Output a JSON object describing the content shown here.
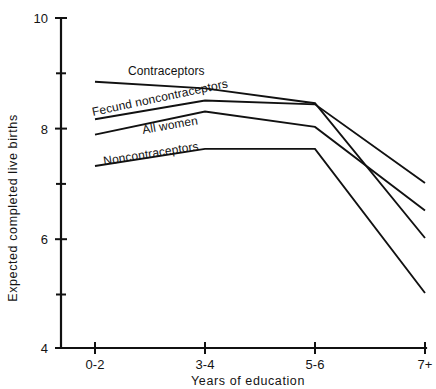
{
  "chart_data": {
    "type": "line",
    "title": "",
    "xlabel": "Years  of  education",
    "ylabel": "Expected  completed  live  births",
    "categories": [
      "0-2",
      "3-4",
      "5-6",
      "7+"
    ],
    "ylim": [
      4,
      10
    ],
    "xlim": [
      0,
      3
    ],
    "grid": false,
    "legend": "inline-labels",
    "y_ticks_major": [
      "4",
      "6",
      "8",
      "10"
    ],
    "y_tick_values_major": [
      4,
      6,
      8,
      10
    ],
    "y_tick_values_minor": [
      5,
      7,
      9
    ],
    "series": [
      {
        "name": "Contraceptors",
        "values": [
          8.84,
          8.72,
          8.45,
          6.0
        ],
        "label": "Contraceptors",
        "label_x": 128,
        "label_y": 75,
        "label_rotation": 0
      },
      {
        "name": "Fecund noncontraceptors",
        "values": [
          8.16,
          8.5,
          8.43,
          7.0
        ],
        "label": "Fecund noncontraceptors",
        "label_x": 93,
        "label_y": 116,
        "label_rotation": -12
      },
      {
        "name": "All women",
        "values": [
          7.88,
          8.3,
          8.02,
          6.5
        ],
        "label": "All women",
        "label_x": 143,
        "label_y": 134,
        "label_rotation": -10
      },
      {
        "name": "Noncontraceptors",
        "values": [
          7.31,
          7.62,
          7.62,
          5.0
        ],
        "label": "Noncontraceptors",
        "label_x": 104,
        "label_y": 165,
        "label_rotation": -9
      }
    ]
  },
  "axes": {
    "y_axis_label": "Expected  completed  live  births",
    "x_axis_label": "Years  of  education",
    "y_max_label": "10",
    "y_labels": [
      "10",
      "8",
      "6",
      "4"
    ],
    "x_labels": [
      "0-2",
      "3-4",
      "5-6",
      "7+"
    ]
  },
  "colors": {
    "ink": "#111111",
    "background": "#ffffff"
  }
}
